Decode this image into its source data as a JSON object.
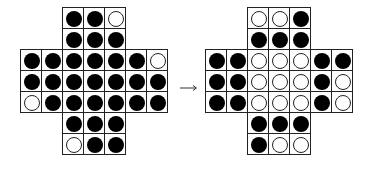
{
  "diagram": {
    "arrow_icon": "right-arrow",
    "cell_size": 22,
    "boards": [
      {
        "name": "before",
        "origin": [
          20,
          7
        ],
        "rows": [
          {
            "row": 0,
            "start_col": 2,
            "pegs": [
              "B",
              "B",
              "W"
            ]
          },
          {
            "row": 1,
            "start_col": 2,
            "pegs": [
              "B",
              "B",
              "B"
            ]
          },
          {
            "row": 2,
            "start_col": 0,
            "pegs": [
              "B",
              "B",
              "B",
              "B",
              "B",
              "B",
              "W"
            ]
          },
          {
            "row": 3,
            "start_col": 0,
            "pegs": [
              "B",
              "B",
              "B",
              "B",
              "B",
              "B",
              "B"
            ]
          },
          {
            "row": 4,
            "start_col": 0,
            "pegs": [
              "W",
              "B",
              "B",
              "B",
              "B",
              "B",
              "B"
            ]
          },
          {
            "row": 5,
            "start_col": 2,
            "pegs": [
              "B",
              "B",
              "B"
            ]
          },
          {
            "row": 6,
            "start_col": 2,
            "pegs": [
              "W",
              "B",
              "B"
            ]
          }
        ]
      },
      {
        "name": "after",
        "origin": [
          205,
          7
        ],
        "rows": [
          {
            "row": 0,
            "start_col": 2,
            "pegs": [
              "W",
              "W",
              "B"
            ]
          },
          {
            "row": 1,
            "start_col": 2,
            "pegs": [
              "B",
              "B",
              "B"
            ]
          },
          {
            "row": 2,
            "start_col": 0,
            "pegs": [
              "B",
              "B",
              "W",
              "W",
              "W",
              "B",
              "B"
            ]
          },
          {
            "row": 3,
            "start_col": 0,
            "pegs": [
              "B",
              "B",
              "W",
              "W",
              "W",
              "B",
              "W"
            ]
          },
          {
            "row": 4,
            "start_col": 0,
            "pegs": [
              "B",
              "B",
              "W",
              "W",
              "W",
              "B",
              "W"
            ]
          },
          {
            "row": 5,
            "start_col": 2,
            "pegs": [
              "B",
              "B",
              "B"
            ]
          },
          {
            "row": 6,
            "start_col": 2,
            "pegs": [
              "B",
              "W",
              "W"
            ]
          }
        ]
      }
    ],
    "legend": {
      "B": "filled peg",
      "W": "empty hole"
    }
  }
}
